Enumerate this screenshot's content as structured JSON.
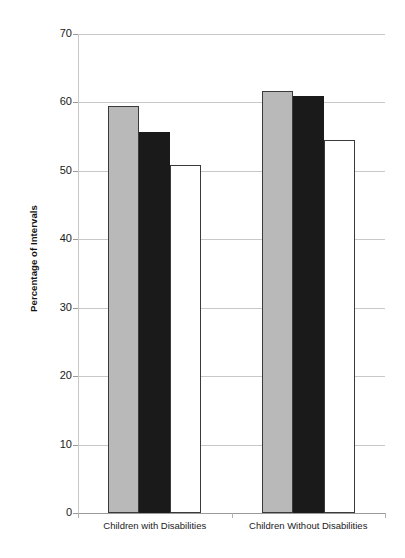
{
  "chart_data": {
    "type": "bar",
    "title": "",
    "subtitle": "",
    "xlabel": "",
    "ylabel": "Percentage of Intervals",
    "categories": [
      "Children with Disabilities",
      "Children Without Disabilities"
    ],
    "series": [
      {
        "name": "Series 1",
        "color": "#b9b9b9",
        "style": "gray-filled",
        "values": [
          59.5,
          61.7
        ]
      },
      {
        "name": "Series 2",
        "color": "#1a1a1a",
        "style": "black-filled",
        "values": [
          55.7,
          61.0
        ]
      },
      {
        "name": "Series 3",
        "color": "#ffffff",
        "style": "white-outlined",
        "values": [
          50.8,
          54.5
        ]
      }
    ],
    "ylim": [
      0,
      70
    ],
    "yticks": [
      0,
      10,
      20,
      30,
      40,
      50,
      60,
      70
    ],
    "ytick_labels": [
      "0",
      "10",
      "20",
      "30",
      "40",
      "50",
      "60",
      "70"
    ],
    "grid": true,
    "grid_axis": "y",
    "legend": "none",
    "legend_position": "none"
  },
  "axis": {
    "y_title": "Percentage of Intervals"
  }
}
